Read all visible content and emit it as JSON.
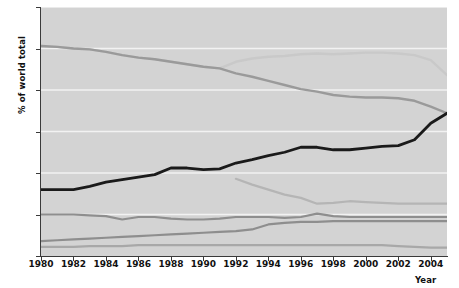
{
  "chart_data": {
    "type": "line",
    "title": "",
    "xlabel": "Year",
    "ylabel": "% of world total",
    "xlim": [
      1980,
      2005
    ],
    "ylim": [
      0,
      30
    ],
    "grid": true,
    "grid_axis": "y",
    "legend": "none",
    "yticks": [
      0,
      5,
      10,
      15,
      20,
      25,
      30
    ],
    "xticks": [
      1980,
      1982,
      1984,
      1986,
      1988,
      1990,
      1992,
      1994,
      1996,
      1998,
      2000,
      2002,
      2004
    ],
    "x": [
      1980,
      1981,
      1982,
      1983,
      1984,
      1985,
      1986,
      1987,
      1988,
      1989,
      1990,
      1991,
      1992,
      1993,
      1994,
      1995,
      1996,
      1997,
      1998,
      1999,
      2000,
      2001,
      2002,
      2003,
      2004,
      2005
    ],
    "series": [
      {
        "name": "series-light-top",
        "color": "#c9c9c9",
        "width": 2.4,
        "x": [
          1980,
          1981,
          1982,
          1983,
          1984,
          1985,
          1986,
          1987,
          1988,
          1989,
          1990,
          1991,
          1992,
          1993,
          1994,
          1995,
          1996,
          1997,
          1998,
          1999,
          2000,
          2001,
          2002,
          2003,
          2004,
          2005
        ],
        "values": [
          25.3,
          25.2,
          25.0,
          24.9,
          24.6,
          24.2,
          23.9,
          23.7,
          23.4,
          23.1,
          22.8,
          22.6,
          23.4,
          23.8,
          24.0,
          24.1,
          24.3,
          24.4,
          24.3,
          24.4,
          24.5,
          24.5,
          24.4,
          24.2,
          23.6,
          21.8
        ]
      },
      {
        "name": "series-gray-declining",
        "color": "#9a9a9a",
        "width": 2.4,
        "x": [
          1980,
          1981,
          1982,
          1983,
          1984,
          1985,
          1986,
          1987,
          1988,
          1989,
          1990,
          1991,
          1992,
          1993,
          1994,
          1995,
          1996,
          1997,
          1998,
          1999,
          2000,
          2001,
          2002,
          2003,
          2004,
          2005
        ],
        "values": [
          25.3,
          25.2,
          25.0,
          24.9,
          24.6,
          24.2,
          23.9,
          23.7,
          23.4,
          23.1,
          22.8,
          22.6,
          22.0,
          21.6,
          21.1,
          20.6,
          20.1,
          19.8,
          19.4,
          19.2,
          19.1,
          19.1,
          19.0,
          18.7,
          18.0,
          17.2
        ]
      },
      {
        "name": "series-black-rising",
        "color": "#1a1a1a",
        "width": 2.8,
        "x": [
          1980,
          1981,
          1982,
          1983,
          1984,
          1985,
          1986,
          1987,
          1988,
          1989,
          1990,
          1991,
          1992,
          1993,
          1994,
          1995,
          1996,
          1997,
          1998,
          1999,
          2000,
          2001,
          2002,
          2003,
          2004,
          2005
        ],
        "values": [
          8.0,
          8.0,
          8.0,
          8.4,
          8.9,
          9.2,
          9.5,
          9.8,
          10.6,
          10.6,
          10.4,
          10.5,
          11.2,
          11.6,
          12.1,
          12.5,
          13.1,
          13.1,
          12.8,
          12.8,
          13.0,
          13.2,
          13.3,
          14.0,
          16.0,
          17.2
        ]
      },
      {
        "name": "series-light-1992-start",
        "color": "#b5b5b5",
        "width": 2.2,
        "x": [
          1992,
          1993,
          1994,
          1995,
          1996,
          1997,
          1998,
          1999,
          2000,
          2001,
          2002,
          2003,
          2004,
          2005
        ],
        "values": [
          9.3,
          8.6,
          8.0,
          7.4,
          7.0,
          6.3,
          6.4,
          6.6,
          6.5,
          6.4,
          6.3,
          6.3,
          6.3,
          6.3
        ]
      },
      {
        "name": "series-mid-flat-five",
        "color": "#8e8e8e",
        "width": 2.2,
        "x": [
          1980,
          1981,
          1982,
          1983,
          1984,
          1985,
          1986,
          1987,
          1988,
          1989,
          1990,
          1991,
          1992,
          1993,
          1994,
          1995,
          1996,
          1997,
          1998,
          1999,
          2000,
          2001,
          2002,
          2003,
          2004,
          2005
        ],
        "values": [
          5.0,
          5.0,
          5.0,
          4.9,
          4.8,
          4.4,
          4.7,
          4.7,
          4.5,
          4.4,
          4.4,
          4.5,
          4.7,
          4.7,
          4.7,
          4.6,
          4.7,
          5.1,
          4.8,
          4.7,
          4.7,
          4.7,
          4.7,
          4.7,
          4.7,
          4.7
        ]
      },
      {
        "name": "series-rising-low",
        "color": "#8e8e8e",
        "width": 2.2,
        "x": [
          1980,
          1981,
          1982,
          1983,
          1984,
          1985,
          1986,
          1987,
          1988,
          1989,
          1990,
          1991,
          1992,
          1993,
          1994,
          1995,
          1996,
          1997,
          1998,
          1999,
          2000,
          2001,
          2002,
          2003,
          2004,
          2005
        ],
        "values": [
          1.8,
          1.9,
          2.0,
          2.1,
          2.2,
          2.3,
          2.4,
          2.5,
          2.6,
          2.7,
          2.8,
          2.9,
          3.0,
          3.2,
          3.8,
          4.0,
          4.1,
          4.1,
          4.2,
          4.2,
          4.2,
          4.2,
          4.2,
          4.2,
          4.2,
          4.2
        ]
      },
      {
        "name": "series-lowest-flat",
        "color": "#a8a8a8",
        "width": 2.2,
        "x": [
          1980,
          1981,
          1982,
          1983,
          1984,
          1985,
          1986,
          1987,
          1988,
          1989,
          1990,
          1991,
          1992,
          1993,
          1994,
          1995,
          1996,
          1997,
          1998,
          1999,
          2000,
          2001,
          2002,
          2003,
          2004,
          2005
        ],
        "values": [
          1.1,
          1.1,
          1.1,
          1.2,
          1.2,
          1.2,
          1.3,
          1.3,
          1.3,
          1.3,
          1.3,
          1.3,
          1.3,
          1.3,
          1.3,
          1.3,
          1.3,
          1.3,
          1.3,
          1.3,
          1.3,
          1.3,
          1.2,
          1.1,
          1.0,
          1.0
        ]
      }
    ]
  }
}
